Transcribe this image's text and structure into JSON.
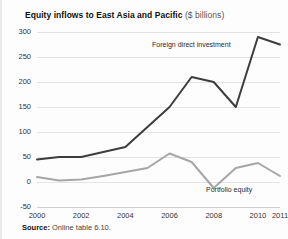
{
  "figure": {
    "title_main": "Equity inflows to East Asia and Pacific",
    "title_units": "($ billions)",
    "source_label": "Source:",
    "source_text": "Online table 6.10."
  },
  "chart_data": {
    "type": "line",
    "title": "Equity inflows to East Asia and Pacific ($ billions)",
    "xlabel": "",
    "ylabel": "",
    "ylim": [
      -50,
      300
    ],
    "yticks": [
      300,
      250,
      200,
      150,
      100,
      50,
      0,
      -50
    ],
    "xticks": [
      "2000",
      "2002",
      "2004",
      "2006",
      "2008",
      "2010",
      "2011"
    ],
    "x": [
      2000,
      2001,
      2002,
      2003,
      2004,
      2005,
      2006,
      2007,
      2008,
      2009,
      2010,
      2011
    ],
    "grid": true,
    "legend": "inline-annotations",
    "series": [
      {
        "name": "Foreign direct investment",
        "color": "#3d3d3d",
        "values": [
          45,
          50,
          50,
          60,
          70,
          110,
          150,
          210,
          200,
          150,
          290,
          275
        ]
      },
      {
        "name": "Portfolio equity",
        "color": "#a6a6a6",
        "values": [
          10,
          3,
          5,
          12,
          20,
          28,
          57,
          40,
          -12,
          28,
          38,
          12
        ]
      }
    ],
    "annotations": [
      {
        "text": "Foreign direct investment",
        "series": "Foreign direct investment"
      },
      {
        "text": "Portfolio equity",
        "series": "Portfolio equity"
      }
    ]
  }
}
